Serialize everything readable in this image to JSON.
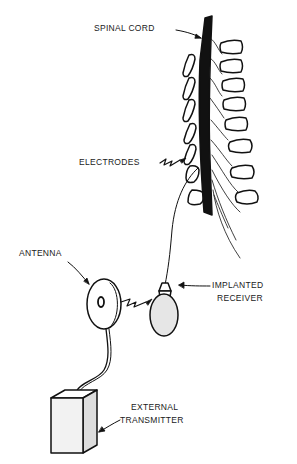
{
  "diagram": {
    "type": "anatomical-device-diagram",
    "colors": {
      "ink": "#111111",
      "background": "#ffffff",
      "shade": "#e6e6e6"
    },
    "labels": {
      "spinal_cord": "SPINAL CORD",
      "electrodes": "ELECTRODES",
      "antenna": "ANTENNA",
      "implanted_receiver_1": "IMPLANTED",
      "implanted_receiver_2": "RECEIVER",
      "external_transmitter_1": "EXTERNAL",
      "external_transmitter_2": "TRANSMITTER"
    },
    "components": [
      "spinal cord",
      "vertebrae",
      "electrodes",
      "lead wire",
      "implanted receiver",
      "antenna",
      "external transmitter"
    ]
  }
}
